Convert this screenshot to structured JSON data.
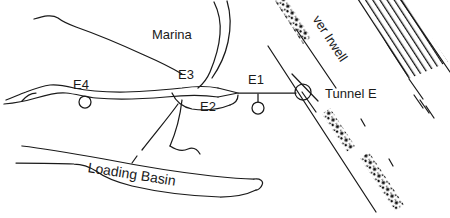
{
  "figure": {
    "kind": "hand-drawn-map",
    "width": 450,
    "height": 218,
    "background_color": "#ffffff",
    "ink_color": "#1a1a1a"
  },
  "labels": {
    "marina": "Marina",
    "river": "ver Irwell",
    "tunnel": "Tunnel E",
    "loading_basin": "Loading Basin",
    "node_e1": "E1",
    "node_e2": "E2",
    "node_e3": "E3",
    "node_e4": "E4"
  },
  "features": {
    "marina_channel": "Marina",
    "river": "ver Irwell",
    "tunnel": "Tunnel E",
    "basin": "Loading Basin"
  },
  "nodes": [
    {
      "id": "E1",
      "label": "E1",
      "marker": "small-circle"
    },
    {
      "id": "E2",
      "label": "E2",
      "marker": "none"
    },
    {
      "id": "E3",
      "label": "E3",
      "marker": "none"
    },
    {
      "id": "E4",
      "label": "E4",
      "marker": "small-circle"
    },
    {
      "id": "TunnelE",
      "label": "Tunnel E",
      "marker": "large-circle"
    }
  ]
}
